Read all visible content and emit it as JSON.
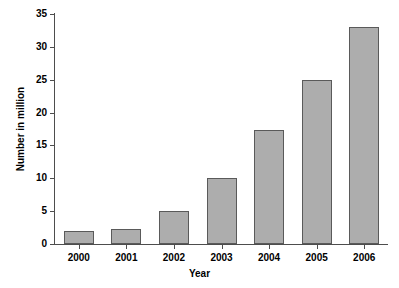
{
  "chart_data": {
    "type": "bar",
    "title": "",
    "subtitle": "",
    "xlabel": "Year",
    "ylabel": "Number in million",
    "categories": [
      "2000",
      "2001",
      "2002",
      "2003",
      "2004",
      "2005",
      "2006"
    ],
    "values": [
      2,
      2.3,
      5,
      10,
      17.3,
      25,
      33
    ],
    "series": [
      {
        "name": "Number in million",
        "values": [
          2,
          2.3,
          5,
          10,
          17.3,
          25,
          33
        ]
      }
    ],
    "ylim": [
      0,
      35
    ],
    "ytick_labels": [
      "0",
      "5",
      "10",
      "15",
      "20",
      "25",
      "30",
      "35"
    ],
    "ytick_values": [
      0,
      5,
      10,
      15,
      20,
      25,
      30,
      35
    ],
    "grid": false,
    "legend": false,
    "legend_position": "none",
    "bar_fill_color": "#adadad",
    "bar_border_color": "#5a5a5a",
    "axis_color": "#4d4d4d",
    "background_color": "#ffffff",
    "text_color": "#000000"
  }
}
